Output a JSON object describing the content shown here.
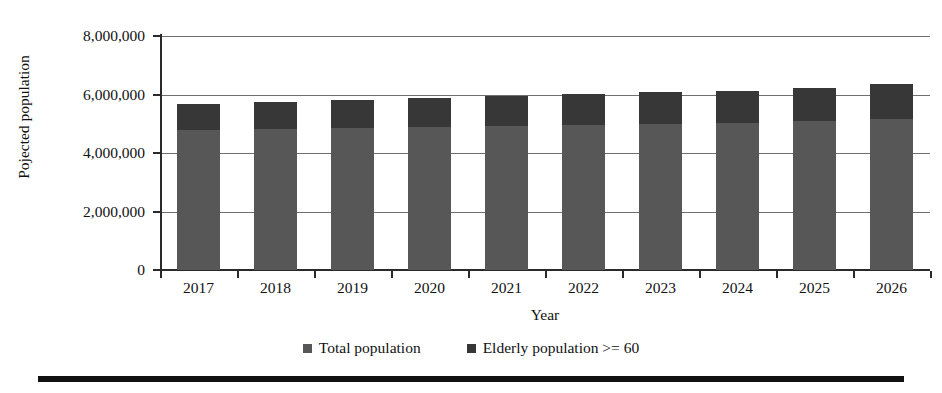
{
  "chart_data": {
    "type": "bar",
    "subtype": "stacked-column",
    "title": "",
    "xlabel": "Year",
    "ylabel": "Pojected population",
    "categories": [
      "2017",
      "2018",
      "2019",
      "2020",
      "2021",
      "2022",
      "2023",
      "2024",
      "2025",
      "2026"
    ],
    "series": [
      {
        "name": "Total population",
        "color": "#575757",
        "values": [
          4790000,
          4820000,
          4850000,
          4890000,
          4920000,
          4960000,
          5000000,
          5040000,
          5080000,
          5160000
        ]
      },
      {
        "name": "Elderly population >= 60",
        "color": "#373737",
        "values": [
          890000,
          930000,
          970000,
          1000000,
          1030000,
          1060000,
          1070000,
          1090000,
          1130000,
          1200000
        ]
      }
    ],
    "stack_totals": [
      5680000,
      5750000,
      5820000,
      5890000,
      5950000,
      6020000,
      6070000,
      6130000,
      6210000,
      6360000
    ],
    "ylim": [
      0,
      8000000
    ],
    "ytick_values": [
      0,
      2000000,
      4000000,
      6000000,
      8000000
    ],
    "ytick_labels": [
      "0",
      "2,000,000",
      "4,000,000",
      "6,000,000",
      "8,000,000"
    ],
    "grid": true,
    "grid_axis": "y",
    "legend_position": "bottom"
  },
  "axes": {
    "y_title": "Pojected population",
    "x_title": "Year",
    "y_ticks": [
      {
        "label": "8,000,000",
        "value": 8000000
      },
      {
        "label": "6,000,000",
        "value": 6000000
      },
      {
        "label": "4,000,000",
        "value": 4000000
      },
      {
        "label": "2,000,000",
        "value": 2000000
      },
      {
        "label": "0",
        "value": 0
      }
    ],
    "x_ticks": [
      "2017",
      "2018",
      "2019",
      "2020",
      "2021",
      "2022",
      "2023",
      "2024",
      "2025",
      "2026"
    ]
  },
  "legend": {
    "items": [
      {
        "label": "Total population",
        "color": "#575757",
        "marker": "square-swatch"
      },
      {
        "label": "Elderly population >= 60",
        "color": "#373737",
        "marker": "square-swatch"
      }
    ]
  },
  "colors": {
    "total_population": "#575757",
    "elderly_population": "#373737",
    "axis": "#2a2a2a",
    "gridline": "#6f6f6f",
    "background": "#ffffff",
    "rule": "#111111"
  }
}
